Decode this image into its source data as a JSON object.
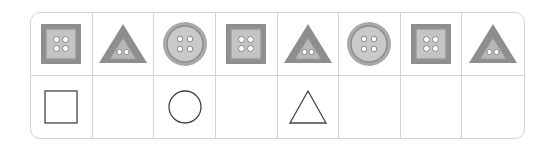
{
  "puzzle": {
    "rows": 2,
    "columns": 8,
    "pattern_row": [
      {
        "shape": "square-button",
        "icon": "square-button-icon"
      },
      {
        "shape": "triangle-button",
        "icon": "triangle-button-icon"
      },
      {
        "shape": "circle-button",
        "icon": "circle-button-icon"
      },
      {
        "shape": "square-button",
        "icon": "square-button-icon"
      },
      {
        "shape": "triangle-button",
        "icon": "triangle-button-icon"
      },
      {
        "shape": "circle-button",
        "icon": "circle-button-icon"
      },
      {
        "shape": "square-button",
        "icon": "square-button-icon"
      },
      {
        "shape": "triangle-button",
        "icon": "triangle-button-icon"
      }
    ],
    "answer_row": [
      {
        "shape": "square-outline",
        "icon": "square-outline-icon"
      },
      {
        "shape": "empty"
      },
      {
        "shape": "circle-outline",
        "icon": "circle-outline-icon"
      },
      {
        "shape": "empty"
      },
      {
        "shape": "triangle-outline",
        "icon": "triangle-outline-icon"
      },
      {
        "shape": "empty"
      },
      {
        "shape": "empty"
      },
      {
        "shape": "empty"
      }
    ]
  },
  "colors": {
    "grid_line": "#d4d4d4",
    "button_dark": "#8e8e8e",
    "button_mid": "#a9a9a9",
    "button_light": "#c9c9c9",
    "outline_stroke": "#444444"
  }
}
